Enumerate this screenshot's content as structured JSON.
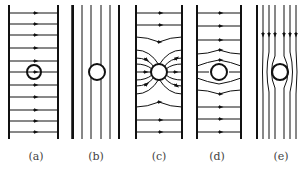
{
  "figure": {
    "type": "field-line diagram",
    "panels": [
      {
        "id": "a",
        "label": "(a)",
        "description": "uniform horizontal field between plates, small circle in center",
        "line_direction": "right"
      },
      {
        "id": "b",
        "label": "(b)",
        "description": "vertical parallel lines, circle unaffecting field"
      },
      {
        "id": "c",
        "label": "(c)",
        "description": "field lines converging into circle (conductor)",
        "line_direction": "right"
      },
      {
        "id": "d",
        "label": "(d)",
        "description": "field lines bending around circle (dielectric/insulator)",
        "line_direction": "right"
      },
      {
        "id": "e",
        "label": "(e)",
        "description": "vertical field lines diverging around circle",
        "line_direction": "down"
      }
    ]
  },
  "colors": {
    "stroke": "#111111",
    "label": "#444444",
    "background": "#ffffff"
  }
}
